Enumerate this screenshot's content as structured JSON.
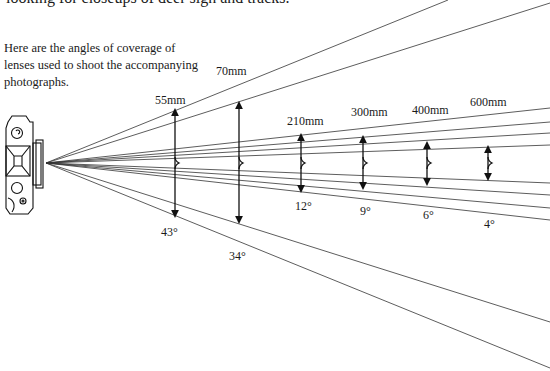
{
  "text": {
    "top_line": "looking for closeups of deer sign and tracks.",
    "caption": "Here are the angles of coverage of lenses used to shoot the accompanying photographs."
  },
  "lenses": [
    {
      "focal": "55mm",
      "angle": "43°"
    },
    {
      "focal": "70mm",
      "angle": "34°"
    },
    {
      "focal": "210mm",
      "angle": "12°"
    },
    {
      "focal": "300mm",
      "angle": "9°"
    },
    {
      "focal": "400mm",
      "angle": "6°"
    },
    {
      "focal": "600mm",
      "angle": "4°"
    }
  ],
  "icons": {
    "camera": "camera-top-view-icon"
  }
}
